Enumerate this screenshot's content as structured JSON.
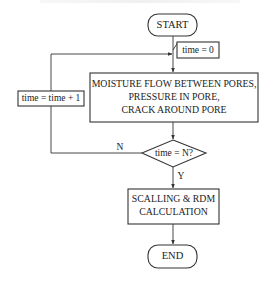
{
  "diagram": {
    "type": "flowchart",
    "nodes": {
      "start": {
        "kind": "terminal",
        "label": "START"
      },
      "init": {
        "kind": "annotation",
        "label": "time = 0"
      },
      "process": {
        "kind": "process",
        "lines": [
          "MOISTURE FLOW BETWEEN PORES,",
          "PRESSURE IN PORE,",
          "CRACK AROUND PORE"
        ]
      },
      "increment": {
        "kind": "process",
        "label": "time = time + 1"
      },
      "decision": {
        "kind": "decision",
        "label": "time = N?"
      },
      "calc": {
        "kind": "process",
        "lines": [
          "SCALLING & RDM",
          "CALCULATION"
        ]
      },
      "end": {
        "kind": "terminal",
        "label": "END"
      }
    },
    "edges": [
      {
        "from": "start",
        "to": "process"
      },
      {
        "from": "process",
        "to": "decision"
      },
      {
        "from": "decision",
        "to": "increment",
        "label": "N"
      },
      {
        "from": "increment",
        "to": "process"
      },
      {
        "from": "decision",
        "to": "calc",
        "label": "Y"
      },
      {
        "from": "calc",
        "to": "end"
      }
    ],
    "edge_labels": {
      "no": "N",
      "yes": "Y"
    }
  }
}
